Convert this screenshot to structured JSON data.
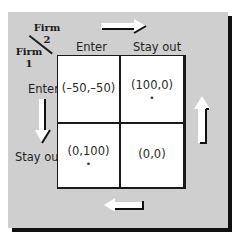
{
  "diagram": {
    "row_player": {
      "name": "Firm",
      "number": "1"
    },
    "col_player": {
      "name": "Firm",
      "number": "2"
    },
    "columns": [
      "Enter",
      "Stay out"
    ],
    "rows": [
      "Enter",
      "Stay out"
    ],
    "payoffs": [
      [
        {
          "value": "(–50,–50)",
          "nash": ""
        },
        {
          "value": "(100,0)",
          "nash": "•"
        }
      ],
      [
        {
          "value": "(0,100)",
          "nash": "•"
        },
        {
          "value": "(0,0)",
          "nash": ""
        }
      ]
    ],
    "arrows": [
      {
        "position": "top",
        "direction": "right"
      },
      {
        "position": "left",
        "direction": "down"
      },
      {
        "position": "right",
        "direction": "up"
      },
      {
        "position": "bottom",
        "direction": "left"
      }
    ],
    "colors": {
      "panel": "#cfcfcf",
      "cell": "#ffffff",
      "border": "#1a1a1a",
      "arrow_fill": "#ffffff"
    }
  }
}
